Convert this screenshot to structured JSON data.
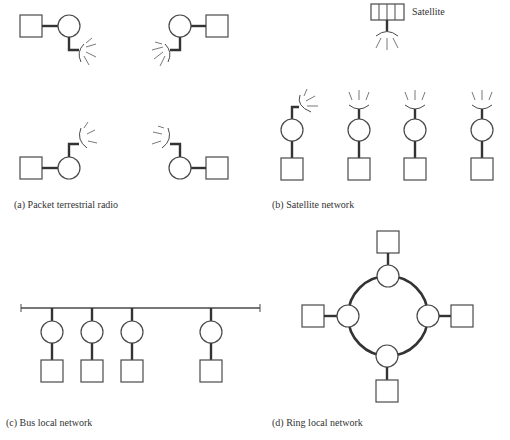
{
  "figure": {
    "panels": [
      {
        "id": "a",
        "caption": "(a) Packet terrestrial radio",
        "stations": 4,
        "connection": "radio antennas (terrestrial)"
      },
      {
        "id": "b",
        "caption": "(b) Satellite network",
        "satellite_label": "Satellite",
        "stations": 4,
        "connection": "antennas to satellite"
      },
      {
        "id": "c",
        "caption": "(c) Bus local network",
        "stations": 4,
        "connection": "shared bus line"
      },
      {
        "id": "d",
        "caption": "(d) Ring local network",
        "stations": 4,
        "connection": "ring"
      }
    ]
  },
  "colors": {
    "line": "#333333",
    "outline": "#4a4a4a",
    "text": "#333333",
    "background": "#ffffff"
  }
}
